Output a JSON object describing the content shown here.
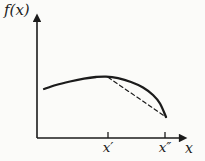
{
  "figure": {
    "background": "#fbfbf9",
    "ink": "#1b1b1b",
    "ylabel": "f(x)",
    "xlabel": "x"
  },
  "chart_data": {
    "type": "line",
    "title": "",
    "xlabel": "x",
    "ylabel": "f(x)",
    "x_tick_labels": [
      "x′",
      "x″"
    ],
    "axes_px": {
      "origin": [
        37,
        138
      ],
      "y_top": [
        37,
        17
      ],
      "x_right": [
        184,
        138
      ]
    },
    "ticks_px": [
      {
        "label": "x′",
        "x": 108
      },
      {
        "label": "x″",
        "x": 165
      }
    ],
    "tick_height": 6,
    "series": [
      {
        "name": "function-curve",
        "style": "solid",
        "width": 2.3,
        "points": [
          [
            44,
            89
          ],
          [
            56,
            85
          ],
          [
            70,
            81.5
          ],
          [
            84,
            78.6
          ],
          [
            96,
            77
          ],
          [
            106,
            76.6
          ],
          [
            118,
            78.2
          ],
          [
            131,
            82
          ],
          [
            143,
            87.5
          ],
          [
            153,
            95
          ],
          [
            160,
            103.5
          ],
          [
            166,
            117
          ]
        ]
      },
      {
        "name": "secant-dashed-line",
        "style": "dashed",
        "width": 1.2,
        "points": [
          [
            108,
            77.3
          ],
          [
            166,
            117
          ]
        ]
      }
    ],
    "annotations": [
      "concave curve of f(x) with dashed chord below it between x′ and x″"
    ]
  }
}
